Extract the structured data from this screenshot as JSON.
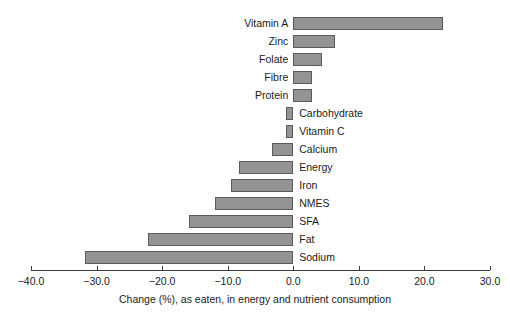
{
  "chart_data": {
    "type": "bar",
    "orientation": "horizontal",
    "title": "",
    "xlabel": "Change (%), as eaten, in energy and nutrient consumption",
    "ylabel": "",
    "xlim": [
      -40.0,
      30.0
    ],
    "xticks": [
      "-40.0",
      "-30.0",
      "-20.0",
      "-10.0",
      "0.0",
      "10.0",
      "20.0",
      "30.0"
    ],
    "xtick_values": [
      -40.0,
      -30.0,
      -20.0,
      -10.0,
      0.0,
      10.0,
      20.0,
      30.0
    ],
    "grid": false,
    "legend": false,
    "categories": [
      "Vitamin A",
      "Zinc",
      "Folate",
      "Fibre",
      "Protein",
      "Carbohydrate",
      "Vitamin C",
      "Calcium",
      "Energy",
      "Iron",
      "NMES",
      "SFA",
      "Fat",
      "Sodium"
    ],
    "values": [
      22.8,
      6.4,
      4.4,
      2.9,
      2.9,
      -1.1,
      -1.1,
      -3.2,
      -8.3,
      -9.5,
      -11.9,
      -15.9,
      -22.2,
      -31.8
    ],
    "bar_fill_color": "#939393",
    "bar_edge_color": "#5b5b5b",
    "axis_color": "#3a3a3a"
  }
}
